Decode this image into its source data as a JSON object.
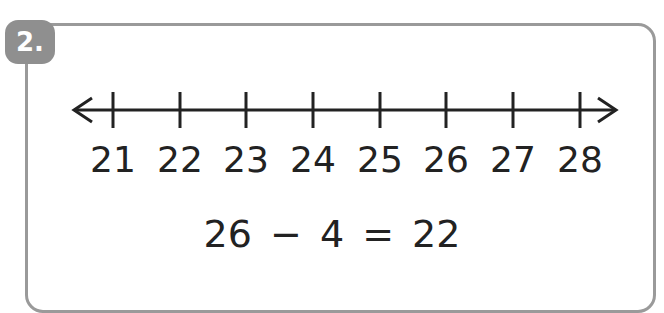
{
  "question": {
    "number_label": "2."
  },
  "number_line": {
    "ticks": [
      {
        "value": "21",
        "x": 113
      },
      {
        "value": "22",
        "x": 180
      },
      {
        "value": "23",
        "x": 246
      },
      {
        "value": "24",
        "x": 313
      },
      {
        "value": "25",
        "x": 380
      },
      {
        "value": "26",
        "x": 446
      },
      {
        "value": "27",
        "x": 513
      },
      {
        "value": "28",
        "x": 580
      }
    ],
    "arrows": "both",
    "line_color": "#222222"
  },
  "equation": {
    "text": "26 − 4 = 22"
  },
  "colors": {
    "badge": "#8f8f8f",
    "border": "#9a9a9a",
    "text": "#222222"
  }
}
